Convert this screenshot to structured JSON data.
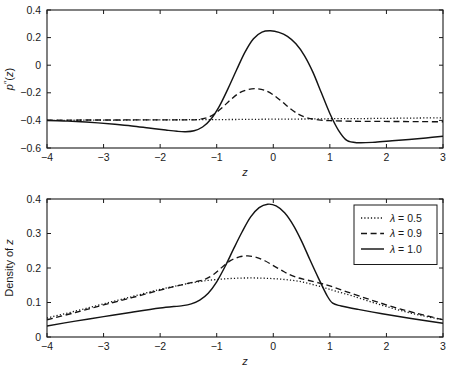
{
  "figure": {
    "background": "#ffffff",
    "ink_color": "#141414"
  },
  "chart_data": [
    {
      "id": "top",
      "type": "line",
      "title": "",
      "xlabel": "z",
      "ylabel": "p''(z)",
      "xlim": [
        -4,
        3
      ],
      "ylim": [
        -0.6,
        0.4
      ],
      "xticks": [
        -4,
        -3,
        -2,
        -1,
        0,
        1,
        2,
        3
      ],
      "xticklabels": [
        "-4",
        "-3",
        "-2",
        "-1",
        "0",
        "1",
        "2",
        "3"
      ],
      "yticks": [
        -0.6,
        -0.4,
        -0.2,
        0,
        0.2,
        0.4
      ],
      "yticklabels": [
        "-0.6",
        "-0.4",
        "-0.2",
        "0",
        "0.2",
        "0.4"
      ],
      "grid": false,
      "legend": null,
      "series": [
        {
          "name": "lambda = 0.5",
          "style": "dotted",
          "x": [
            -4,
            -3.5,
            -3,
            -2.5,
            -2,
            -1.5,
            -1,
            -0.5,
            0,
            0.5,
            1,
            1.5,
            2,
            2.5,
            3
          ],
          "values": [
            -0.4,
            -0.399,
            -0.398,
            -0.397,
            -0.396,
            -0.395,
            -0.394,
            -0.393,
            -0.391,
            -0.39,
            -0.388,
            -0.387,
            -0.385,
            -0.383,
            -0.381
          ]
        },
        {
          "name": "lambda = 0.9",
          "style": "dashed",
          "x": [
            -4,
            -3.6,
            -3.2,
            -2.8,
            -2.4,
            -2,
            -1.7,
            -1.5,
            -1.35,
            -1.2,
            -1.05,
            -0.9,
            -0.75,
            -0.6,
            -0.45,
            -0.3,
            -0.15,
            0,
            0.15,
            0.3,
            0.45,
            0.6,
            0.8,
            1,
            1.4,
            1.8,
            2.2,
            2.6,
            3
          ],
          "values": [
            -0.398,
            -0.398,
            -0.397,
            -0.397,
            -0.396,
            -0.396,
            -0.396,
            -0.396,
            -0.394,
            -0.384,
            -0.356,
            -0.306,
            -0.249,
            -0.201,
            -0.177,
            -0.17,
            -0.182,
            -0.215,
            -0.263,
            -0.315,
            -0.356,
            -0.381,
            -0.396,
            -0.402,
            -0.406,
            -0.407,
            -0.408,
            -0.409,
            -0.41
          ]
        },
        {
          "name": "lambda = 1.0",
          "style": "solid",
          "x": [
            -4,
            -3.7,
            -3.4,
            -3.1,
            -2.8,
            -2.5,
            -2.2,
            -1.9,
            -1.7,
            -1.55,
            -1.4,
            -1.25,
            -1.1,
            -0.95,
            -0.8,
            -0.65,
            -0.5,
            -0.35,
            -0.2,
            -0.05,
            0.1,
            0.25,
            0.4,
            0.55,
            0.7,
            0.85,
            1.0,
            1.15,
            1.3,
            1.5,
            1.8,
            2.1,
            2.4,
            2.7,
            3
          ],
          "values": [
            -0.4,
            -0.404,
            -0.41,
            -0.418,
            -0.428,
            -0.44,
            -0.455,
            -0.47,
            -0.479,
            -0.482,
            -0.475,
            -0.448,
            -0.39,
            -0.295,
            -0.17,
            -0.035,
            0.095,
            0.192,
            0.24,
            0.249,
            0.238,
            0.209,
            0.155,
            0.07,
            -0.05,
            -0.2,
            -0.35,
            -0.47,
            -0.545,
            -0.562,
            -0.558,
            -0.548,
            -0.538,
            -0.527,
            -0.515
          ]
        }
      ]
    },
    {
      "id": "bottom",
      "type": "line",
      "title": "",
      "xlabel": "z",
      "ylabel": "Density of z",
      "xlim": [
        -4,
        3
      ],
      "ylim": [
        0,
        0.4
      ],
      "xticks": [
        -4,
        -3,
        -2,
        -1,
        0,
        1,
        2,
        3
      ],
      "xticklabels": [
        "-4",
        "-3",
        "-2",
        "-1",
        "0",
        "1",
        "2",
        "3"
      ],
      "yticks": [
        0,
        0.1,
        0.2,
        0.3,
        0.4
      ],
      "yticklabels": [
        "0",
        "0.1",
        "0.2",
        "0.3",
        "0.4"
      ],
      "grid": false,
      "legend": {
        "position": "top-right",
        "entries": [
          {
            "label": "λ = 0.5",
            "style": "dotted"
          },
          {
            "label": "λ = 0.9",
            "style": "dashed"
          },
          {
            "label": "λ = 1.0",
            "style": "solid"
          }
        ]
      },
      "series": [
        {
          "name": "lambda = 0.5",
          "style": "dotted",
          "x": [
            -4,
            -3.5,
            -3,
            -2.5,
            -2,
            -1.6,
            -1.3,
            -1.1,
            -0.9,
            -0.7,
            -0.5,
            -0.3,
            -0.1,
            0.1,
            0.3,
            0.5,
            0.7,
            0.9,
            1.1,
            1.4,
            1.8,
            2.2,
            2.6,
            3
          ],
          "values": [
            0.055,
            0.075,
            0.096,
            0.117,
            0.138,
            0.152,
            0.161,
            0.165,
            0.168,
            0.17,
            0.171,
            0.171,
            0.17,
            0.168,
            0.165,
            0.16,
            0.152,
            0.143,
            0.133,
            0.119,
            0.098,
            0.079,
            0.063,
            0.05
          ]
        },
        {
          "name": "lambda = 0.9",
          "style": "dashed",
          "x": [
            -4,
            -3.5,
            -3,
            -2.5,
            -2,
            -1.6,
            -1.35,
            -1.2,
            -1.05,
            -0.9,
            -0.75,
            -0.6,
            -0.45,
            -0.3,
            -0.15,
            0,
            0.15,
            0.3,
            0.45,
            0.6,
            0.8,
            1.0,
            1.3,
            1.7,
            2.1,
            2.5,
            3
          ],
          "values": [
            0.05,
            0.071,
            0.093,
            0.114,
            0.136,
            0.152,
            0.161,
            0.168,
            0.182,
            0.203,
            0.222,
            0.232,
            0.235,
            0.231,
            0.221,
            0.207,
            0.193,
            0.18,
            0.171,
            0.165,
            0.157,
            0.148,
            0.131,
            0.109,
            0.088,
            0.07,
            0.05
          ]
        },
        {
          "name": "lambda = 1.0",
          "style": "solid",
          "x": [
            -4,
            -3.5,
            -3,
            -2.5,
            -2,
            -1.6,
            -1.45,
            -1.3,
            -1.15,
            -1.0,
            -0.85,
            -0.7,
            -0.55,
            -0.4,
            -0.25,
            -0.1,
            0.05,
            0.2,
            0.35,
            0.5,
            0.65,
            0.8,
            0.95,
            1.05,
            1.2,
            1.5,
            1.9,
            2.3,
            2.7,
            3
          ],
          "values": [
            0.032,
            0.046,
            0.059,
            0.072,
            0.084,
            0.091,
            0.096,
            0.107,
            0.127,
            0.16,
            0.205,
            0.256,
            0.305,
            0.348,
            0.375,
            0.385,
            0.38,
            0.36,
            0.325,
            0.278,
            0.223,
            0.17,
            0.12,
            0.098,
            0.09,
            0.08,
            0.068,
            0.057,
            0.047,
            0.04
          ]
        }
      ]
    }
  ]
}
